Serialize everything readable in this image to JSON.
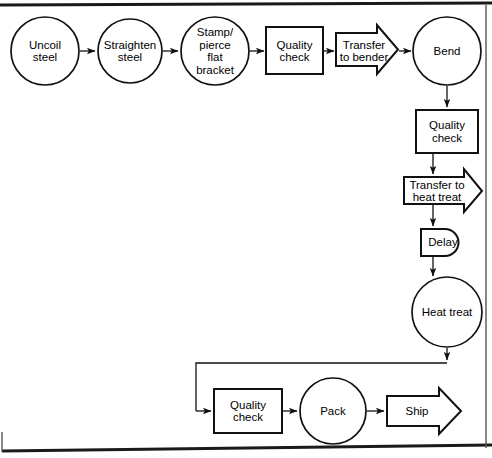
{
  "diagram": {
    "stroke_color": "#111111",
    "fill_color": "#ffffff",
    "border": {
      "top_rule": "thick-horizontal-rule",
      "bottom_rule": "thick-horizontal-rule",
      "right_rule": "thin-vertical-rule"
    },
    "nodes": [
      {
        "id": "uncoil-steel",
        "shape": "circle",
        "label": "Uncoil\nsteel",
        "cx": 45,
        "cy": 51,
        "r": 34
      },
      {
        "id": "straighten-steel",
        "shape": "circle",
        "label": "Straighten\nsteel",
        "cx": 130,
        "cy": 51,
        "r": 32
      },
      {
        "id": "stamp-pierce",
        "shape": "circle",
        "label": "Stamp/\npierce\nflat\nbracket",
        "cx": 215,
        "cy": 51,
        "r": 34
      },
      {
        "id": "quality-check-1",
        "shape": "rect",
        "label": "Quality\ncheck",
        "x": 266,
        "y": 27,
        "w": 57,
        "h": 47
      },
      {
        "id": "transfer-to-bender",
        "shape": "arrow",
        "label": "Transfer\nto bender",
        "x": 336,
        "y": 27,
        "w": 62,
        "h": 45
      },
      {
        "id": "bend",
        "shape": "circle",
        "label": "Bend",
        "cx": 447,
        "cy": 51,
        "r": 34
      },
      {
        "id": "quality-check-2",
        "shape": "rect",
        "label": "Quality\ncheck",
        "x": 416,
        "y": 110,
        "w": 62,
        "h": 43
      },
      {
        "id": "transfer-to-heat-treat",
        "shape": "arrow",
        "label": "Transfer to\nheat treat",
        "x": 404,
        "y": 171,
        "w": 78,
        "h": 40
      },
      {
        "id": "delay",
        "shape": "delay",
        "label": "Delay",
        "x": 421,
        "y": 228,
        "w": 48,
        "h": 27
      },
      {
        "id": "heat-treat",
        "shape": "circle",
        "label": "Heat treat",
        "cx": 447,
        "cy": 312,
        "r": 35
      },
      {
        "id": "quality-check-3",
        "shape": "rect",
        "label": "Quality\ncheck",
        "x": 214,
        "y": 389,
        "w": 68,
        "h": 44
      },
      {
        "id": "pack",
        "shape": "circle",
        "label": "Pack",
        "cx": 333,
        "cy": 411,
        "r": 33
      },
      {
        "id": "ship",
        "shape": "arrow",
        "label": "Ship",
        "x": 387,
        "y": 390,
        "w": 74,
        "h": 42
      }
    ],
    "connectors": [
      {
        "id": "uncoil-to-straighten",
        "from": "uncoil-steel",
        "to": "straighten-steel",
        "kind": "straight-right-arrow"
      },
      {
        "id": "straighten-to-stamp",
        "from": "straighten-steel",
        "to": "stamp-pierce",
        "kind": "straight-right-arrow"
      },
      {
        "id": "stamp-to-quality-check-1",
        "from": "stamp-pierce",
        "to": "quality-check-1",
        "kind": "straight-right-arrow"
      },
      {
        "id": "quality-check-1-to-transfer",
        "from": "quality-check-1",
        "to": "transfer-to-bender",
        "kind": "straight-right-arrow"
      },
      {
        "id": "transfer-to-bend",
        "from": "transfer-to-bender",
        "to": "bend",
        "kind": "straight-right-arrow"
      },
      {
        "id": "bend-to-quality-check-2",
        "from": "bend",
        "to": "quality-check-2",
        "kind": "straight-down-arrow"
      },
      {
        "id": "quality-check-2-to-transfer",
        "from": "quality-check-2",
        "to": "transfer-to-heat-treat",
        "kind": "straight-down-arrow"
      },
      {
        "id": "transfer-to-delay",
        "from": "transfer-to-heat-treat",
        "to": "delay",
        "kind": "straight-down-arrow"
      },
      {
        "id": "delay-to-heat-treat",
        "from": "delay",
        "to": "heat-treat",
        "kind": "straight-down-arrow"
      },
      {
        "id": "heat-treat-to-quality-check-3",
        "from": "heat-treat",
        "to": "quality-check-3",
        "kind": "down-left-down-elbow-arrow"
      },
      {
        "id": "quality-check-3-to-pack",
        "from": "quality-check-3",
        "to": "pack",
        "kind": "straight-right-arrow"
      },
      {
        "id": "pack-to-ship",
        "from": "pack",
        "to": "ship",
        "kind": "straight-right-arrow"
      }
    ]
  }
}
